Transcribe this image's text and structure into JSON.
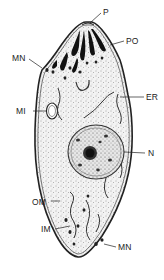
{
  "diagram": {
    "labels": {
      "P": "P",
      "PO": "PO",
      "MN_top": "MN",
      "MI": "MI",
      "ER": "ER",
      "N": "N",
      "OM": "OM",
      "IM": "IM",
      "MN_bottom": "MN"
    }
  }
}
